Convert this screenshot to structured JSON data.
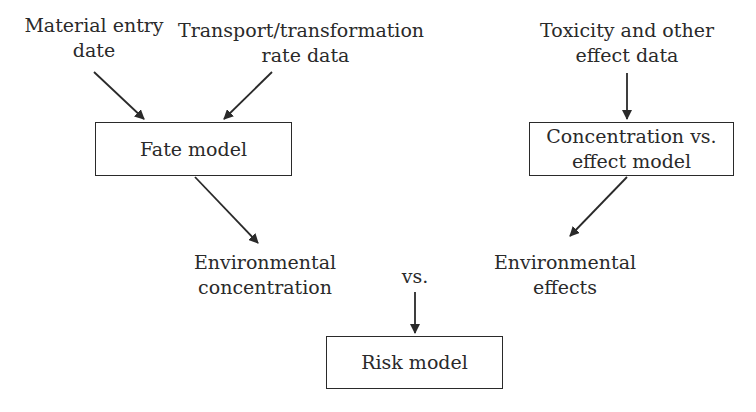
{
  "diagram": {
    "inputs": {
      "material_entry": [
        "Material entry",
        "date"
      ],
      "transport_rate": [
        "Transport/transformation",
        "rate data"
      ],
      "toxicity": [
        "Toxicity and other",
        "effect data"
      ]
    },
    "boxes": {
      "fate_model": "Fate model",
      "concentration_effect_model": [
        "Concentration vs.",
        "effect model"
      ],
      "risk_model": "Risk model"
    },
    "outputs": {
      "environmental_concentration": [
        "Environmental",
        "concentration"
      ],
      "environmental_effects": [
        "Environmental",
        "effects"
      ]
    },
    "comparison_label": "vs.",
    "colors": {
      "line": "#2a2a2a",
      "background": "#ffffff"
    }
  }
}
